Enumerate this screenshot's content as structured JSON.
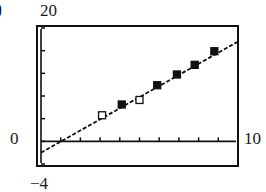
{
  "panel": {
    "label": ")"
  },
  "axes": {
    "ymax_label": "20",
    "ymin_label": "−4",
    "xmin_label": "0",
    "xmax_label": "10"
  },
  "colors": {
    "ink": "#111111",
    "background": "#ffffff"
  },
  "chart_data": {
    "type": "scatter",
    "title": "",
    "xlabel": "",
    "ylabel": "",
    "xlim": [
      0,
      10
    ],
    "ylim": [
      -4,
      20
    ],
    "x_tick_step": 1,
    "y_tick_step": 4,
    "grid": false,
    "series": [
      {
        "name": "open-squares",
        "marker": "open-square",
        "points": [
          {
            "x": 3.1,
            "y": 4.6
          },
          {
            "x": 5.0,
            "y": 7.3
          }
        ]
      },
      {
        "name": "filled-squares",
        "marker": "filled-square",
        "points": [
          {
            "x": 4.1,
            "y": 6.5
          },
          {
            "x": 5.9,
            "y": 9.9
          },
          {
            "x": 6.9,
            "y": 11.8
          },
          {
            "x": 7.8,
            "y": 13.5
          },
          {
            "x": 8.8,
            "y": 15.9
          }
        ]
      }
    ],
    "regression_line": {
      "style": "dashed",
      "x": [
        0,
        10
      ],
      "y": [
        -2.0,
        17.6
      ]
    }
  }
}
